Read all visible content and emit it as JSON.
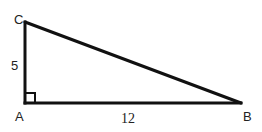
{
  "diagram": {
    "type": "right-triangle",
    "stroke_color": "#111111",
    "vertices": {
      "A": {
        "label": "A",
        "x": 25,
        "y": 103
      },
      "B": {
        "label": "B",
        "x": 241,
        "y": 103
      },
      "C": {
        "label": "C",
        "x": 25,
        "y": 22
      }
    },
    "sides": {
      "AC": {
        "label": "5"
      },
      "AB": {
        "label": "12"
      }
    },
    "right_angle_at": "A"
  }
}
